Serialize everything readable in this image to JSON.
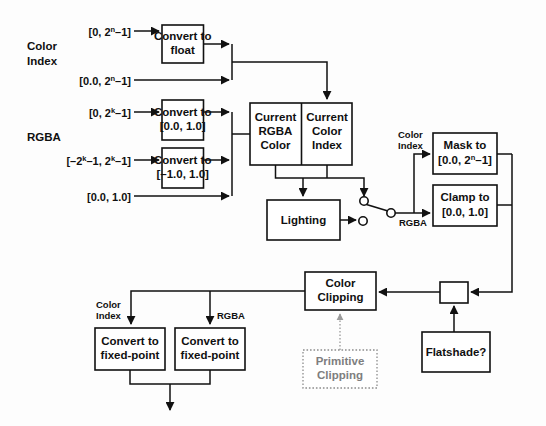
{
  "diagram": {
    "colors": {
      "stroke": "#111111",
      "background": "#ffffff",
      "dotted_stroke": "#8d8d8d",
      "dotted_text": "#7e7e7e"
    },
    "group_labels": {
      "color_index": {
        "line1": "Color",
        "line2": "Index"
      },
      "rgba": "RGBA"
    },
    "inputs": {
      "color_index_int": {
        "pre": "[0, 2",
        "sup": "n",
        "post": "–1]"
      },
      "color_index_float": {
        "pre": "[0.0, 2",
        "sup": "n",
        "post": "–1]"
      },
      "rgba_unsigned": {
        "pre": "[0, 2",
        "sup": "k",
        "post": "–1]"
      },
      "rgba_signed": {
        "pre": "[–2",
        "sup": "k",
        "mid": "–1, 2",
        "sup2": "k",
        "post": "–1]"
      },
      "rgba_float": "[0.0, 1.0]"
    },
    "boxes": {
      "convert_float": {
        "line1": "Convert to",
        "line2": "float"
      },
      "convert_0_1": {
        "line1": "Convert to",
        "line2": "[0.0, 1.0]"
      },
      "convert_neg1_1": {
        "line1": "Convert to",
        "line2": "[–1.0, 1.0]"
      },
      "current_rgba_color": {
        "line1": "Current",
        "line2": "RGBA",
        "line3": "Color"
      },
      "current_color_index": {
        "line1": "Current",
        "line2": "Color",
        "line3": "Index"
      },
      "lighting": "Lighting",
      "mask_to": {
        "line1": "Mask to",
        "pre": "[0.0, 2",
        "sup": "n",
        "post": "–1]"
      },
      "clamp_to": {
        "line1": "Clamp to",
        "line2": "[0.0, 1.0]"
      },
      "color_clipping": {
        "line1": "Color",
        "line2": "Clipping"
      },
      "primitive_clipping": {
        "line1": "Primitive",
        "line2": "Clipping"
      },
      "flatshade": "Flatshade?",
      "convert_fixed_point_index": {
        "line1": "Convert to",
        "line2": "fixed-point"
      },
      "convert_fixed_point_rgba": {
        "line1": "Convert to",
        "line2": "fixed-point"
      },
      "merge_junction": ""
    },
    "path_labels": {
      "switch_color_index": {
        "line1": "Color",
        "line2": "Index"
      },
      "switch_rgba": "RGBA",
      "bottom_color_index": {
        "line1": "Color",
        "line2": "Index"
      },
      "bottom_rgba": "RGBA"
    }
  }
}
